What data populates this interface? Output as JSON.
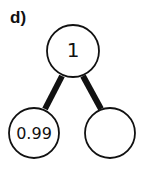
{
  "panel_label": "d)",
  "tree": {
    "nodes": [
      {
        "id": "root",
        "label": "1",
        "cx": 73,
        "cy": 51,
        "r": 26
      },
      {
        "id": "left",
        "label": "0.99",
        "cx": 34,
        "cy": 133,
        "r": 25
      },
      {
        "id": "right",
        "label": "",
        "cx": 110,
        "cy": 133,
        "r": 25
      }
    ],
    "edges": [
      {
        "from": "root",
        "to": "left",
        "x1": 62,
        "y1": 76,
        "x2": 45,
        "y2": 109
      },
      {
        "from": "root",
        "to": "right",
        "x1": 83,
        "y1": 76,
        "x2": 101,
        "y2": 109
      }
    ],
    "colors": {
      "stroke": "#111111",
      "fill": "#ffffff"
    }
  }
}
